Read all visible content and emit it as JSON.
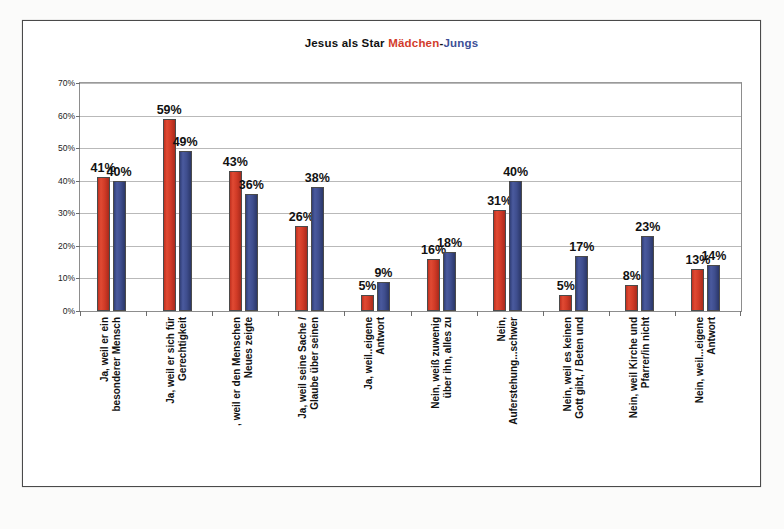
{
  "title": {
    "main": "Jesus als Star ",
    "girls": "Mädchen",
    "dash": "-",
    "boys": "Jungs"
  },
  "colors": {
    "girls": "#d23b2b",
    "boys": "#3c4f96",
    "frame": "#4a4a4a",
    "grid": "#b9b9b9"
  },
  "axis": {
    "ticks": [
      "70%",
      "60%",
      "50%",
      "40%",
      "30%",
      "20%",
      "10%",
      "0%"
    ]
  },
  "footer": "",
  "chart_data": {
    "type": "bar",
    "title": "Jesus als Star Mädchen-Jungs",
    "xlabel": "",
    "ylabel": "",
    "ylim": [
      0,
      70
    ],
    "ytick_values": [
      0,
      10,
      20,
      30,
      40,
      50,
      60,
      70
    ],
    "grid": true,
    "legend_position": "title",
    "categories": [
      "Ja, weil er ein besonderer Mensch",
      "Ja, weil er sich für Gerechtigkeit",
      ", weil er den Menschen Neues zeigte",
      "Ja, weil seine Sache / Glaube über seinen",
      "Ja, weil..eigene Antwort",
      "Nein, weiß zuwenig über ihn, alles zu",
      "Nein, Auferstehung...schwer",
      "Nein, weil es keinen Gott gibt, / Beten und",
      "Nein, weil Kirche und Pfarrer/in nicht",
      "Nein, weil...eigene Antwort"
    ],
    "category_lines": [
      [
        "Ja, weil er ein",
        "besonderer Mensch"
      ],
      [
        "Ja, weil er sich für",
        "Gerechtigkeit"
      ],
      [
        ", weil er den Menschen",
        "Neues zeigte"
      ],
      [
        "Ja, weil seine Sache /",
        "Glaube über seinen"
      ],
      [
        "Ja, weil..eigene",
        "Antwort"
      ],
      [
        "Nein, weiß zuwenig",
        "über ihn, alles zu"
      ],
      [
        "Nein,",
        "Auferstehung...schwer"
      ],
      [
        "Nein, weil es keinen",
        "Gott gibt, / Beten und"
      ],
      [
        "Nein, weil Kirche und",
        "Pfarrer/in nicht"
      ],
      [
        "Nein, weil...eigene",
        "Antwort"
      ]
    ],
    "series": [
      {
        "name": "Mädchen",
        "color": "#d23b2b",
        "values": [
          41,
          59,
          43,
          26,
          5,
          16,
          31,
          5,
          8,
          13
        ]
      },
      {
        "name": "Jungs",
        "color": "#3c4f96",
        "values": [
          40,
          49,
          36,
          38,
          9,
          18,
          40,
          17,
          23,
          14
        ]
      }
    ],
    "value_labels": [
      "41%",
      "40%",
      "59%",
      "49%",
      "43%",
      "36%",
      "26%",
      "38%",
      "5%",
      "9%",
      "16%",
      "18%",
      "31%",
      "40%",
      "5%",
      "17%",
      "8%",
      "23%",
      "13%",
      "14%"
    ]
  }
}
